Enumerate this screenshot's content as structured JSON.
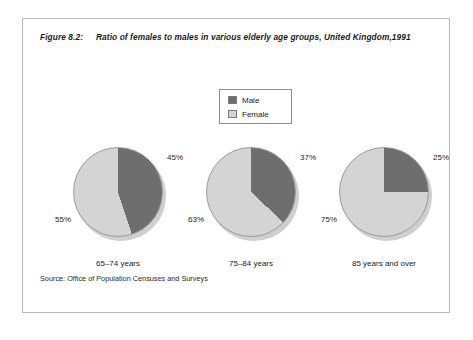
{
  "figure": {
    "number": "Figure 8.2:",
    "title": "Ratio of females to males in various elderly age groups, United Kingdom,1991",
    "source": "Source: Office of Population Censuses and Surveys"
  },
  "legend": {
    "items": [
      {
        "label": "Male",
        "color": "#6e6e6e"
      },
      {
        "label": "Female",
        "color": "#d4d4d4"
      }
    ]
  },
  "colors": {
    "male": "#6e6e6e",
    "female": "#d4d4d4",
    "frame": "#b9b9b9",
    "pie_outline": "#9a9a9a",
    "pie_shadow": "#cfcfcf"
  },
  "chart_data": {
    "type": "pie",
    "title": "Ratio of females to males in various elderly age groups, United Kingdom,1991",
    "categories": [
      "65–74 years",
      "75–84 years",
      "85 years and over"
    ],
    "series": [
      {
        "name": "Male",
        "values": [
          45,
          37,
          25
        ]
      },
      {
        "name": "Female",
        "values": [
          55,
          63,
          75
        ]
      }
    ],
    "unit": "%",
    "legend_position": "top-center",
    "grid": false,
    "charts": [
      {
        "category": "65–74 years",
        "slices": [
          {
            "name": "Male",
            "value": 45,
            "label": "45%"
          },
          {
            "name": "Female",
            "value": 55,
            "label": "55%"
          }
        ]
      },
      {
        "category": "75–84 years",
        "slices": [
          {
            "name": "Male",
            "value": 37,
            "label": "37%"
          },
          {
            "name": "Female",
            "value": 63,
            "label": "63%"
          }
        ]
      },
      {
        "category": "85 years and over",
        "slices": [
          {
            "name": "Male",
            "value": 25,
            "label": "25%"
          },
          {
            "name": "Female",
            "value": 75,
            "label": "75%"
          }
        ]
      }
    ]
  }
}
